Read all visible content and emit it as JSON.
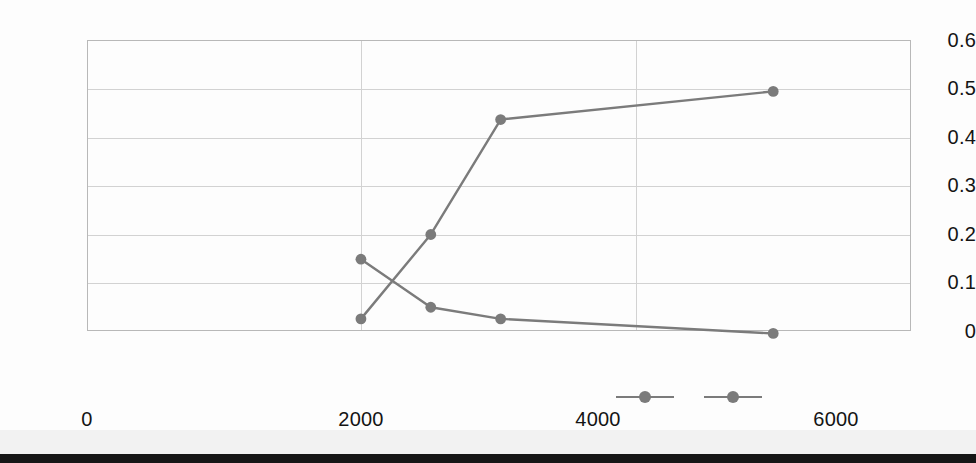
{
  "chart_data": {
    "type": "line",
    "title": "",
    "subtitle": "",
    "xlabel": "",
    "ylabel": "",
    "xlim": [
      0,
      6016
    ],
    "ylim": [
      0,
      0.6
    ],
    "xticks": [
      "0",
      "2000",
      "4000",
      "6000"
    ],
    "xtick_values": [
      0,
      2000,
      4000,
      6000
    ],
    "yticks": [
      "0",
      "0.1",
      "0.2",
      "0.3",
      "0.4",
      "0.5",
      "0.6"
    ],
    "ytick_values": [
      0,
      0.1,
      0.2,
      0.3,
      0.4,
      0.5,
      0.6
    ],
    "grid": "horizontal-and-vertical",
    "legend_position": "bottom-center",
    "legend_labels": [
      "",
      ""
    ],
    "marker": "circle",
    "line_color": "#7b7b7b",
    "marker_color": "#7b7b7b",
    "gridline_color": "#d2d2d2",
    "axis_color": "#b8b8b8",
    "series": [
      {
        "name": "series-1",
        "label": "",
        "color": "#7b7b7b",
        "x": [
          2000,
          2510,
          3020,
          5010
        ],
        "values": [
          0.148,
          0.049,
          0.025,
          -0.005
        ]
      },
      {
        "name": "series-2",
        "label": "",
        "color": "#7b7b7b",
        "x": [
          2000,
          2510,
          3020,
          5010
        ],
        "values": [
          0.025,
          0.199,
          0.436,
          0.494
        ]
      }
    ]
  },
  "legend": {
    "items": [
      {
        "name": "legend-series-1",
        "label": ""
      },
      {
        "name": "legend-series-2",
        "label": ""
      }
    ]
  }
}
